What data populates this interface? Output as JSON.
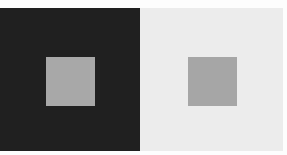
{
  "illusion": {
    "name": "simultaneous contrast",
    "panels": [
      {
        "id": "left",
        "background": "#202020",
        "square_color": "#a8a8a8"
      },
      {
        "id": "right",
        "background": "#ececec",
        "square_color": "#a6a6a6"
      }
    ]
  }
}
